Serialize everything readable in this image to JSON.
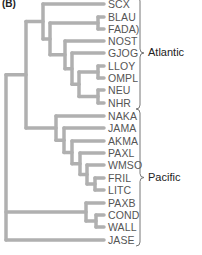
{
  "panel_label": "(B)",
  "style": {
    "branch_color": "#b0b0b0",
    "branch_width": 3.5,
    "bracket_color": "#777777"
  },
  "leaves": [
    {
      "name": "SCX",
      "y": 4
    },
    {
      "name": "BLAU",
      "y": 17
    },
    {
      "name": "FADA)",
      "y": 29
    },
    {
      "name": "NOST",
      "y": 41
    },
    {
      "name": "GJOG",
      "y": 53
    },
    {
      "name": "LLOY",
      "y": 66
    },
    {
      "name": "OMPL",
      "y": 78
    },
    {
      "name": "NEU",
      "y": 90
    },
    {
      "name": "NHR",
      "y": 103
    },
    {
      "name": "NAKA",
      "y": 116
    },
    {
      "name": "JAMA",
      "y": 128
    },
    {
      "name": "AKMA",
      "y": 141
    },
    {
      "name": "PAXL",
      "y": 153
    },
    {
      "name": "WMSO",
      "y": 165
    },
    {
      "name": "FRIL",
      "y": 178
    },
    {
      "name": "LITC",
      "y": 190
    },
    {
      "name": "PAXB",
      "y": 203
    },
    {
      "name": "COND",
      "y": 215
    },
    {
      "name": "WALL",
      "y": 227
    },
    {
      "name": "JASE",
      "y": 240
    }
  ],
  "groups": [
    {
      "label": "Atlantic",
      "from": 0,
      "to": 8
    },
    {
      "label": "Pacific",
      "from": 9,
      "to": 19
    }
  ],
  "tree": {
    "x": 6,
    "children": [
      {
        "x": 26,
        "children": [
          {
            "x": 43,
            "children": [
              {
                "leaf": 0
              },
              {
                "x": 50,
                "children": [
                  {
                    "x": 98,
                    "children": [
                      {
                        "leaf": 1
                      },
                      {
                        "leaf": 2
                      }
                    ]
                  },
                  {
                    "x": 65,
                    "children": [
                      {
                        "leaf": 3
                      },
                      {
                        "x": 72,
                        "children": [
                          {
                            "leaf": 4
                          },
                          {
                            "x": 79,
                            "children": [
                              {
                                "x": 98,
                                "children": [
                                  {
                                    "leaf": 5
                                  },
                                  {
                                    "leaf": 6
                                  }
                                ]
                              },
                              {
                                "x": 98,
                                "children": [
                                  {
                                    "leaf": 7
                                  },
                                  {
                                    "leaf": 8
                                  }
                                ]
                              }
                            ]
                          }
                        ]
                      }
                    ]
                  }
                ]
              }
            ]
          },
          {
            "x": 56,
            "children": [
              {
                "leaf": 9
              },
              {
                "x": 64,
                "children": [
                  {
                    "leaf": 10
                  },
                  {
                    "x": 72,
                    "children": [
                      {
                        "leaf": 11
                      },
                      {
                        "x": 80,
                        "children": [
                          {
                            "leaf": 12
                          },
                          {
                            "x": 87,
                            "children": [
                              {
                                "leaf": 13
                              },
                              {
                                "x": 95,
                                "children": [
                                  {
                                    "leaf": 14
                                  },
                                  {
                                    "leaf": 15
                                  }
                                ]
                              }
                            ]
                          }
                        ]
                      }
                    ]
                  }
                ]
              }
            ]
          }
        ]
      },
      {
        "x": 86,
        "children": [
          {
            "leaf": 16
          },
          {
            "x": 96,
            "children": [
              {
                "leaf": 17
              },
              {
                "leaf": 18
              }
            ]
          }
        ]
      },
      {
        "leaf": 19
      }
    ]
  }
}
